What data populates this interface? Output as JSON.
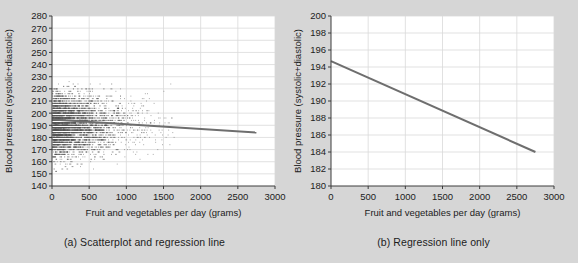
{
  "figure": {
    "background_color": "#d6d6d6",
    "plot_background_color": "#ffffff",
    "axis_color": "#3c3c3c",
    "grid_color": "#d9d9d9",
    "line_color": "#6e6e6e",
    "point_color": "#555555"
  },
  "panels": [
    {
      "id": "a",
      "caption": "(a) Scatterplot and regression line"
    },
    {
      "id": "b",
      "caption": "(b) Regression line only"
    }
  ],
  "chart_data": [
    {
      "type": "scatter",
      "title": "(a) Scatterplot and regression line",
      "xlabel": "Fruit and vegetables per day (grams)",
      "ylabel": "Blood pressure (systolic+diastolic)",
      "xlim": [
        0,
        3000
      ],
      "ylim": [
        140,
        280
      ],
      "xticks": [
        0,
        500,
        1000,
        1500,
        2000,
        2500,
        3000
      ],
      "yticks": [
        140,
        150,
        160,
        170,
        180,
        190,
        200,
        210,
        220,
        230,
        240,
        250,
        260,
        270,
        280
      ],
      "grid": true,
      "legend": "none",
      "series": [
        {
          "name": "Observations",
          "type": "scatter",
          "description": "Dense cloud of individual subjects, heavily concentrated between 0 and 1000 grams per day, spanning the full blood pressure range 140-280, with sparse points extending out to about 2750 grams.",
          "n_points_approx": 4000
        },
        {
          "name": "Regression line",
          "type": "line",
          "x": [
            0,
            2750
          ],
          "y": [
            194.7,
            184.0
          ],
          "slope_per_gram": -0.0039,
          "intercept": 194.7
        }
      ]
    },
    {
      "type": "line",
      "title": "(b) Regression line only",
      "xlabel": "Fruit and vegetables per day (grams)",
      "ylabel": "Blood pressure (systolic+diastolic)",
      "xlim": [
        0,
        3000
      ],
      "ylim": [
        180,
        200
      ],
      "xticks": [
        0,
        500,
        1000,
        1500,
        2000,
        2500,
        3000
      ],
      "yticks": [
        180,
        182,
        184,
        186,
        188,
        190,
        192,
        194,
        196,
        198,
        200
      ],
      "grid": true,
      "legend": "none",
      "series": [
        {
          "name": "Regression line",
          "type": "line",
          "x": [
            0,
            2750
          ],
          "y": [
            194.7,
            184.0
          ],
          "slope_per_gram": -0.0039,
          "intercept": 194.7
        }
      ]
    }
  ]
}
